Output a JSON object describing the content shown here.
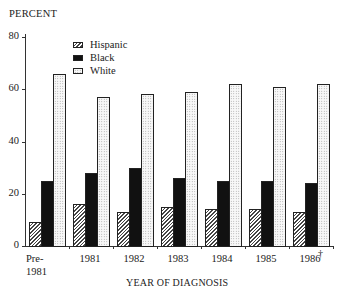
{
  "chart_data": {
    "type": "bar",
    "title": "",
    "ylabel": "PERCENT",
    "xlabel": "YEAR OF DIAGNOSIS",
    "ylim": [
      0,
      80
    ],
    "yticks": [
      0,
      20,
      40,
      60,
      80
    ],
    "categories": [
      "Pre-1981",
      "1981",
      "1982",
      "1983",
      "1984",
      "1985",
      "1986"
    ],
    "category_labels": [
      [
        "Pre-",
        "1981"
      ],
      [
        "1981"
      ],
      [
        "1982"
      ],
      [
        "1983"
      ],
      [
        "1984"
      ],
      [
        "1985"
      ],
      [
        "1986"
      ]
    ],
    "series": [
      {
        "name": "Hispanic",
        "pattern": "hatched",
        "values": [
          9,
          16,
          13,
          15,
          14,
          14,
          13
        ]
      },
      {
        "name": "Black",
        "pattern": "solid-black",
        "values": [
          25,
          28,
          30,
          26,
          25,
          25,
          24
        ]
      },
      {
        "name": "White",
        "pattern": "dotted",
        "values": [
          66,
          57,
          58,
          59,
          62,
          61,
          62
        ]
      }
    ],
    "legend_position": "upper-left-inside",
    "grid": false,
    "annotations": [
      {
        "category": "1986",
        "symbol": "†"
      }
    ]
  },
  "labels": {
    "ylabel": "PERCENT",
    "xlabel": "YEAR OF DIAGNOSIS",
    "legend": [
      "Hispanic",
      "Black",
      "White"
    ],
    "dagger": "†"
  }
}
